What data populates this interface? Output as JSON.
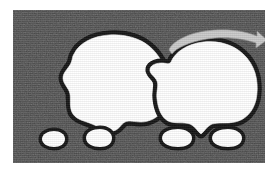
{
  "figure": {
    "title": "Two-stage blob deformation diagram",
    "caption": "",
    "panel": {
      "background_color": "#4a4a4a",
      "outline_color": "#141414",
      "fill_color": "#ffffff",
      "arrow_color": "#c9c9c9",
      "page_color": "#ffffff",
      "x": 13,
      "y": 10,
      "width": 252,
      "height": 153,
      "texture": "grainy-halftone"
    }
  },
  "chart_data": {
    "type": "diagram",
    "title": "Two-stage blob deformation diagram",
    "xlabel": "",
    "ylabel": "",
    "grid": false,
    "legend": "none",
    "series": [
      {
        "name": "stage-1-blob",
        "label": "",
        "role": "before",
        "fill": "#ffffff",
        "stroke": "#141414",
        "centroid": [
          97,
          82
        ],
        "approx_width": 100,
        "approx_height": 82,
        "satellites": 2
      },
      {
        "name": "stage-2-blob",
        "label": "",
        "role": "after",
        "fill": "#ffffff",
        "stroke": "#141414",
        "centroid": [
          196,
          80
        ],
        "approx_width": 94,
        "approx_height": 80,
        "satellites": 2
      }
    ],
    "annotations": [
      {
        "name": "transition-arrow",
        "label": "",
        "type": "curved-arrow",
        "from": [
          160,
          40
        ],
        "to": [
          245,
          35
        ],
        "direction": "left-to-right",
        "color": "#c9c9c9"
      }
    ]
  },
  "shapes": {
    "panel_rect": "M0,0 H252 V153 H0 Z",
    "left_blob": "M61,44 C66,33 80,26 96,25 C112,24 126,28 136,36 C146,44 152,56 154,68 C156,80 155,92 150,100 C145,108 136,112 128,112 C122,112 116,110 112,112 C108,114 106,120 100,121 C93,122 86,117 79,114 C72,111 64,110 60,104 C56,98 58,90 57,84 C56,78 50,74 50,68 C50,62 56,58 58,53 C60,48 59,47 61,44 Z",
    "left_blob_satellite_a": "M29,129 C29,124 35,121 41,121 C47,121 52,124 52,129 C52,134 47,137 41,137 C35,137 29,134 29,129 Z",
    "left_blob_satellite_b": "M73,128 C73,122 80,119 87,119 C94,119 99,123 99,128 C99,134 94,137 87,137 C80,137 73,134 73,128 Z",
    "right_blob": "M158,52 C162,42 174,34 190,32 C208,30 224,36 234,48 C244,60 246,76 243,90 C240,102 232,110 222,112 C214,114 205,112 199,114 C194,116 191,122 188,124 C185,122 182,116 177,114 C171,112 162,114 155,111 C148,107 145,98 144,89 C143,81 146,76 144,71 C142,66 136,64 137,59 C138,54 145,53 149,53 C153,53 156,55 158,52 Z",
    "right_blob_satellite_a": "M149,128 C149,122 157,119 165,119 C173,119 179,123 179,128 C179,134 173,137 165,137 C157,137 149,134 149,128 Z",
    "right_blob_satellite_b": "M199,128 C199,122 207,119 215,119 C223,119 229,123 229,128 C229,134 223,137 215,137 C207,137 199,134 199,128 Z",
    "arrow": "M156,40 C158,33 172,24 192,21 C214,18 232,21 244,26 L244,21 L254,30 L243,38 L243,33 C231,29 214,26 194,29 C176,32 163,38 159,44 Z"
  }
}
